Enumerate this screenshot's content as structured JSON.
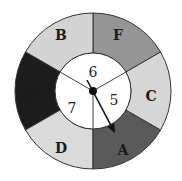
{
  "diagram": {
    "type": "spinner",
    "center": [
      93,
      91
    ],
    "outer_radius": 78,
    "inner_radius": 38,
    "outer_ring": {
      "segments": [
        {
          "label": "F",
          "start_deg": 30,
          "end_deg": 90,
          "color": "#959595",
          "label_pos": [
            118,
            35
          ]
        },
        {
          "label": "B",
          "start_deg": 90,
          "end_deg": 150,
          "color": "#d3d3d3",
          "label_pos": [
            61,
            35
          ]
        },
        {
          "label": "E",
          "start_deg": 150,
          "end_deg": 210,
          "color": "#1c1c1c",
          "label_pos": [
            31,
            96
          ]
        },
        {
          "label": "D",
          "start_deg": 210,
          "end_deg": 270,
          "color": "#dadada",
          "label_pos": [
            61,
            148
          ]
        },
        {
          "label": "A",
          "start_deg": 270,
          "end_deg": 330,
          "color": "#5a5a5a",
          "label_pos": [
            123,
            150
          ]
        },
        {
          "label": "C",
          "start_deg": 330,
          "end_deg": 390,
          "color": "#d6d6d6",
          "label_pos": [
            151,
            96
          ]
        }
      ]
    },
    "inner_circle": {
      "color": "#ffffff",
      "sections": [
        {
          "label": "6",
          "start_deg": 30,
          "end_deg": 150,
          "label_pos": [
            93,
            72
          ]
        },
        {
          "label": "7",
          "start_deg": 150,
          "end_deg": 270,
          "label_pos": [
            72,
            108
          ]
        },
        {
          "label": "5",
          "start_deg": 270,
          "end_deg": 390,
          "label_pos": [
            114,
            100
          ]
        }
      ]
    },
    "pointer": {
      "from": [
        87,
        80
      ],
      "to": [
        115,
        133
      ],
      "points_to": "A",
      "color": "#111111"
    },
    "hub": {
      "radius": 4,
      "color": "#111111"
    },
    "stroke_color": "#333333"
  }
}
